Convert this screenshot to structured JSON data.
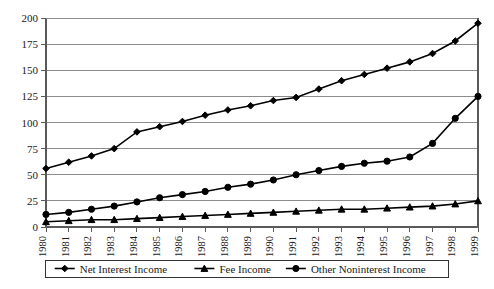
{
  "chart_data": {
    "type": "line",
    "title": "",
    "subtitle": "",
    "xlabel": "",
    "ylabel": "",
    "categories": [
      "1980",
      "1981",
      "1982",
      "1983",
      "1984",
      "1985",
      "1986",
      "1987",
      "1988",
      "1989",
      "1990",
      "1991",
      "1992",
      "1993",
      "1994",
      "1995",
      "1996",
      "1997",
      "1998",
      "1999"
    ],
    "xlim": [
      1980,
      1999
    ],
    "ylim": [
      0,
      200
    ],
    "yticks": [
      0,
      25,
      50,
      75,
      100,
      125,
      150,
      175,
      200
    ],
    "grid": true,
    "legend_position": "bottom",
    "series": [
      {
        "name": "Net Interest Income",
        "marker": "diamond",
        "color": "#000000",
        "values": [
          56,
          62,
          68,
          75,
          91,
          96,
          101,
          107,
          112,
          116,
          121,
          124,
          132,
          140,
          146,
          152,
          158,
          166,
          178,
          195
        ]
      },
      {
        "name": "Fee Income",
        "marker": "triangle",
        "color": "#000000",
        "values": [
          5,
          6,
          7,
          7,
          8,
          9,
          10,
          11,
          12,
          13,
          14,
          15,
          16,
          17,
          17,
          18,
          19,
          20,
          22,
          25
        ]
      },
      {
        "name": "Other Noninterest Income",
        "marker": "circle",
        "color": "#000000",
        "values": [
          12,
          14,
          17,
          20,
          24,
          28,
          31,
          34,
          38,
          41,
          45,
          50,
          54,
          58,
          61,
          63,
          67,
          80,
          104,
          125
        ]
      }
    ]
  },
  "legend": {
    "items": [
      {
        "label": "Net Interest Income",
        "marker": "diamond"
      },
      {
        "label": "Fee Income",
        "marker": "triangle"
      },
      {
        "label": "Other Noninterest Income",
        "marker": "circle"
      }
    ]
  },
  "axes": {
    "y_tick_labels": [
      "200",
      "175",
      "150",
      "125",
      "100",
      "75",
      "50",
      "25",
      "0"
    ],
    "x_tick_labels": [
      "1980",
      "1981",
      "1982",
      "1983",
      "1984",
      "1985",
      "1986",
      "1987",
      "1988",
      "1989",
      "1990",
      "1991",
      "1992",
      "1993",
      "1994",
      "1995",
      "1996",
      "1997",
      "1998",
      "1999"
    ]
  }
}
